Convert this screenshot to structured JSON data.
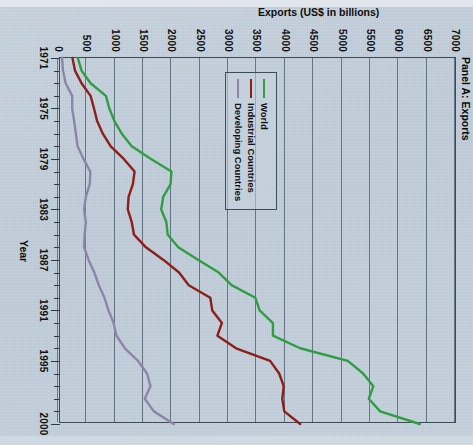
{
  "figure": {
    "panel_title": "Panel A: Exports",
    "background_color": "#c2cfdb",
    "axis_color": "#3d4a58"
  },
  "legend": {
    "position": "inside-left",
    "items": [
      {
        "label": "World",
        "color": "#2f9e41"
      },
      {
        "label": "Industrial Countries",
        "color": "#8d1f1b"
      },
      {
        "label": "Developing Countries",
        "color": "#8b86a8"
      }
    ]
  },
  "chart_data": {
    "type": "line",
    "title": "Panel A: Exports",
    "xlabel": "Year",
    "ylabel": "Exports (US$ in billions)",
    "xlim": [
      1971,
      2000
    ],
    "ylim": [
      0,
      7000
    ],
    "ytick_step": 500,
    "yticks": [
      0,
      500,
      1000,
      1500,
      2000,
      2500,
      3000,
      3500,
      4000,
      4500,
      5000,
      5500,
      6000,
      6500,
      7000
    ],
    "ytick_labels": [
      "0",
      "500",
      "1000",
      "1500",
      "2000",
      "2500",
      "3000",
      "3500",
      "4000",
      "4500",
      "5000",
      "5500",
      "6000",
      "6500",
      "7000"
    ],
    "xticks": [
      1971,
      1975,
      1979,
      1983,
      1987,
      1991,
      1995,
      2000
    ],
    "xtick_labels": [
      "1971",
      "1975",
      "1979",
      "1983",
      "1987",
      "1991",
      "1995",
      "2000"
    ],
    "xtick_minor_step": 1,
    "grid": "vertical-only-on-y-values",
    "legend_position": "inside-left",
    "x": [
      1971,
      1972,
      1973,
      1974,
      1975,
      1976,
      1977,
      1978,
      1979,
      1980,
      1981,
      1982,
      1983,
      1984,
      1985,
      1986,
      1987,
      1988,
      1989,
      1990,
      1991,
      1992,
      1993,
      1994,
      1995,
      1996,
      1997,
      1998,
      1999,
      2000
    ],
    "series": [
      {
        "name": "World",
        "color": "#2f9e41",
        "values": [
          350,
          415,
          575,
          845,
          905,
          995,
          1125,
          1300,
          1640,
          2000,
          1985,
          1855,
          1820,
          1910,
          1935,
          2120,
          2475,
          2835,
          3060,
          3480,
          3555,
          3790,
          3790,
          4270,
          5110,
          5380,
          5560,
          5480,
          5680,
          6380
        ]
      },
      {
        "name": "Industrial Countries",
        "color": "#8d1f1b",
        "values": [
          255,
          300,
          415,
          575,
          635,
          690,
          790,
          930,
          1160,
          1350,
          1320,
          1245,
          1230,
          1300,
          1340,
          1550,
          1860,
          2135,
          2305,
          2685,
          2720,
          2890,
          2810,
          3140,
          3740,
          3900,
          3980,
          3955,
          3990,
          4270
        ]
      },
      {
        "name": "Developing Countries",
        "color": "#8b86a8",
        "values": [
          70,
          88,
          135,
          250,
          250,
          285,
          315,
          345,
          450,
          570,
          560,
          490,
          460,
          490,
          470,
          460,
          540,
          640,
          720,
          820,
          890,
          980,
          1030,
          1180,
          1410,
          1570,
          1630,
          1530,
          1690,
          2040
        ]
      }
    ]
  }
}
